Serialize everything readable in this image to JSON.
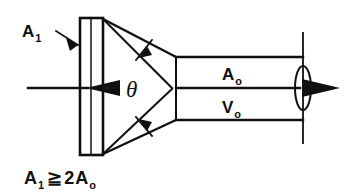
{
  "figure": {
    "stroke_color": "#101010",
    "background_color": "#ffffff",
    "labels": {
      "inlet_area": {
        "symbol": "A",
        "subscript": "1"
      },
      "outlet_area": {
        "symbol": "A",
        "subscript": "o"
      },
      "outlet_velocity": {
        "symbol": "V",
        "subscript": "o"
      },
      "cone_angle": "θ"
    },
    "caption": {
      "lhs_symbol": "A",
      "lhs_subscript": "1",
      "relation": "≧",
      "coefficient": "2",
      "rhs_symbol": "A",
      "rhs_subscript": "o"
    },
    "icons": {
      "inlet_flow_arrow": "flow-arrow-right",
      "outlet_flow_arrow": "flow-arrow-right",
      "angle_arrow_upper": "angle-dimension-arrow",
      "angle_arrow_lower": "angle-dimension-arrow",
      "leader": "leader-line-arrow"
    }
  }
}
